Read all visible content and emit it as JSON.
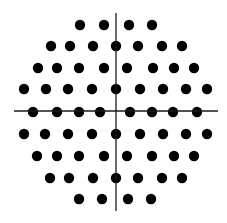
{
  "diagram": {
    "type": "dot-grid-with-axes",
    "colors": {
      "background": "#ffffff",
      "dot": "#000000",
      "axis": "#1a1a1a"
    },
    "dot_radius": 5.2,
    "axes": {
      "vertical": {
        "x": 116,
        "y1": 13,
        "y2": 211
      },
      "horizontal": {
        "y": 111,
        "x1": 14,
        "x2": 218
      }
    },
    "rows": [
      {
        "y": 25,
        "xs": [
          80,
          104,
          129,
          152
        ]
      },
      {
        "y": 46,
        "xs": [
          51,
          70,
          93,
          116,
          138,
          162,
          182
        ]
      },
      {
        "y": 68,
        "xs": [
          38,
          57,
          79,
          104,
          127,
          153,
          174,
          194
        ]
      },
      {
        "y": 89,
        "xs": [
          24,
          46,
          68,
          92,
          116,
          140,
          163,
          186,
          207
        ]
      },
      {
        "y": 112,
        "xs": [
          33,
          57,
          79,
          100,
          130,
          152,
          173,
          197
        ]
      },
      {
        "y": 134,
        "xs": [
          24,
          45,
          68,
          92,
          116,
          140,
          163,
          186,
          207
        ]
      },
      {
        "y": 156,
        "xs": [
          37,
          57,
          79,
          104,
          127,
          152,
          174,
          194
        ]
      },
      {
        "y": 178,
        "xs": [
          50,
          69,
          93,
          116,
          138,
          162,
          182
        ]
      },
      {
        "y": 199,
        "xs": [
          79,
          102,
          128,
          151
        ]
      }
    ]
  }
}
